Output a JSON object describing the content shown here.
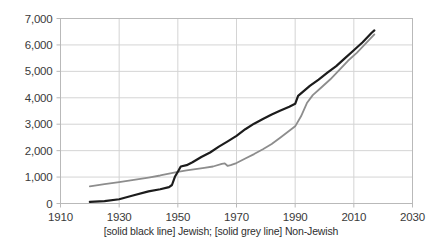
{
  "caption": "[solid black line] Jewish; [solid grey line] Non-Jewish",
  "colors": {
    "series_jewish": "#1c1c1c",
    "series_non_jewish": "#8d8d8d",
    "grid": "#d4d4d4",
    "axis": "#b9b9b9",
    "tick_label": "#3a3a3a",
    "background": "#ffffff"
  },
  "axes": {
    "y_ticks": [
      "0",
      "1,000",
      "2,000",
      "3,000",
      "4,000",
      "5,000",
      "6,000",
      "7,000"
    ],
    "x_ticks": [
      "1910",
      "1930",
      "1950",
      "1970",
      "1990",
      "2010",
      "2030"
    ]
  },
  "chart_data": {
    "type": "line",
    "title": "",
    "subtitle": "",
    "xlabel": "",
    "ylabel": "",
    "xlim": [
      1910,
      2030
    ],
    "ylim": [
      0,
      7000
    ],
    "x_tick_values": [
      1910,
      1930,
      1950,
      1970,
      1990,
      2010,
      2030
    ],
    "y_tick_values": [
      0,
      1000,
      2000,
      3000,
      4000,
      5000,
      6000,
      7000
    ],
    "grid": "horizontal-and-vertical",
    "legend_position": "below-plot-as-caption",
    "annotations": [
      "[solid black line] Jewish; [solid grey line] Non-Jewish"
    ],
    "series": [
      {
        "name": "Jewish",
        "style": "solid black line",
        "color": "#1c1c1c",
        "x": [
          1920,
          1925,
          1930,
          1935,
          1940,
          1944,
          1947,
          1948,
          1949,
          1950,
          1951,
          1953,
          1955,
          1958,
          1961,
          1964,
          1967,
          1970,
          1973,
          1976,
          1979,
          1982,
          1985,
          1988,
          1990,
          1991,
          1993,
          1995,
          1998,
          2001,
          2004,
          2007,
          2010,
          2013,
          2016,
          2017
        ],
        "y": [
          60,
          90,
          160,
          310,
          460,
          540,
          620,
          700,
          1010,
          1200,
          1400,
          1450,
          1560,
          1760,
          1930,
          2150,
          2350,
          2560,
          2810,
          3020,
          3200,
          3370,
          3520,
          3660,
          3770,
          4070,
          4260,
          4450,
          4690,
          4950,
          5200,
          5500,
          5800,
          6100,
          6450,
          6550
        ]
      },
      {
        "name": "Non-Jewish",
        "style": "solid grey line",
        "color": "#8d8d8d",
        "x": [
          1920,
          1925,
          1930,
          1935,
          1940,
          1944,
          1947,
          1950,
          1953,
          1956,
          1959,
          1962,
          1965,
          1966,
          1967,
          1968,
          1970,
          1973,
          1976,
          1979,
          1982,
          1985,
          1988,
          1990,
          1992,
          1994,
          1996,
          1999,
          2002,
          2005,
          2008,
          2011,
          2014,
          2017
        ],
        "y": [
          650,
          730,
          810,
          890,
          980,
          1060,
          1130,
          1200,
          1250,
          1300,
          1350,
          1400,
          1500,
          1520,
          1420,
          1450,
          1530,
          1700,
          1870,
          2050,
          2250,
          2500,
          2750,
          2920,
          3300,
          3800,
          4100,
          4400,
          4700,
          5050,
          5400,
          5700,
          6050,
          6400
        ]
      }
    ]
  }
}
